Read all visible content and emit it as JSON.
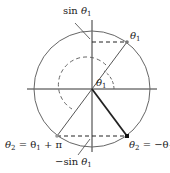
{
  "diagram": {
    "labels": {
      "sin_top": {
        "prefix": "sin ",
        "var": "θ",
        "sub": "1"
      },
      "theta1_point": {
        "var": "θ",
        "sub": "1"
      },
      "theta1_angle": {
        "var": "θ",
        "sub": "1"
      },
      "theta2_left": {
        "var": "θ",
        "sub": "2",
        "rest": " = θ",
        "sub2": "1",
        "tail": " + π"
      },
      "theta2_right": {
        "var": "θ",
        "sub": "2",
        "rest": " = −θ",
        "sub2": "1"
      },
      "neg_sin": {
        "prefix": "−sin ",
        "var": "θ",
        "sub": "1"
      }
    },
    "colors": {
      "circle": "#555555",
      "line": "#444444",
      "bold_line": "#222222"
    }
  }
}
